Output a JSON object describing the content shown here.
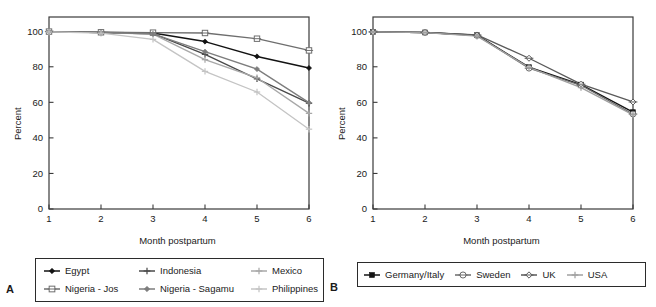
{
  "figure": {
    "panels": [
      {
        "letter": "A",
        "xlabel": "Month postpartum",
        "ylabel": "Percent"
      },
      {
        "letter": "B",
        "xlabel": "Month postpartum",
        "ylabel": "Percent"
      }
    ]
  },
  "chart_data": [
    {
      "type": "line",
      "panel": "A",
      "title": "",
      "xlabel": "Month postpartum",
      "ylabel": "Percent",
      "x": [
        1,
        2,
        3,
        4,
        5,
        6
      ],
      "xticklabels": [
        "1",
        "2",
        "3",
        "4",
        "5",
        "6"
      ],
      "yticklabels": [
        "0",
        "20",
        "40",
        "60",
        "80",
        "100"
      ],
      "xlim": [
        1,
        6
      ],
      "ylim": [
        0,
        108
      ],
      "grid": false,
      "legend_position": "below-axes",
      "series": [
        {
          "name": "Egypt",
          "color": "#121212",
          "marker": "filled-diamond",
          "values": [
            99.8,
            99.3,
            99.0,
            94.2,
            85.8,
            79.3
          ]
        },
        {
          "name": "Indonesia",
          "color": "#4a4a4a",
          "marker": "plus",
          "values": [
            99.8,
            99.3,
            98.6,
            87.0,
            73.2,
            59.5
          ]
        },
        {
          "name": "Mexico",
          "color": "#a8a8a8",
          "marker": "plus",
          "values": [
            99.8,
            99.2,
            98.4,
            84.0,
            73.8,
            53.8
          ]
        },
        {
          "name": "Nigeria - Jos",
          "color": "#6e6e6e",
          "marker": "open-square",
          "values": [
            99.8,
            99.4,
            99.2,
            99.0,
            95.8,
            89.2
          ]
        },
        {
          "name": "Nigeria - Sagamu",
          "color": "#7d7d7d",
          "marker": "filled-diamond",
          "values": [
            99.8,
            99.3,
            98.5,
            88.5,
            78.7,
            59.8
          ]
        },
        {
          "name": "Philippines",
          "color": "#c4c4c4",
          "marker": "plus",
          "values": [
            99.6,
            98.9,
            95.4,
            77.4,
            65.8,
            44.9
          ]
        }
      ]
    },
    {
      "type": "line",
      "panel": "B",
      "title": "",
      "xlabel": "Month postpartum",
      "ylabel": "Percent",
      "x": [
        1,
        2,
        3,
        4,
        5,
        6
      ],
      "xticklabels": [
        "1",
        "2",
        "3",
        "4",
        "5",
        "6"
      ],
      "yticklabels": [
        "0",
        "20",
        "40",
        "60",
        "80",
        "100"
      ],
      "xlim": [
        1,
        6
      ],
      "ylim": [
        0,
        108
      ],
      "grid": false,
      "legend_position": "below-axes",
      "series": [
        {
          "name": "Germany/Italy",
          "color": "#141414",
          "marker": "filled-square",
          "values": [
            99.6,
            99.3,
            97.8,
            79.8,
            70.0,
            54.5
          ]
        },
        {
          "name": "Sweden",
          "color": "#6b6b6b",
          "marker": "open-circle",
          "values": [
            99.6,
            99.3,
            97.6,
            79.2,
            69.6,
            53.4
          ]
        },
        {
          "name": "UK",
          "color": "#5a5a5a",
          "marker": "open-diamond",
          "values": [
            99.6,
            99.3,
            97.9,
            84.8,
            70.2,
            60.2
          ]
        },
        {
          "name": "USA",
          "color": "#a0a0a0",
          "marker": "plus",
          "values": [
            99.6,
            99.2,
            97.2,
            79.6,
            68.3,
            52.9
          ]
        }
      ]
    }
  ]
}
